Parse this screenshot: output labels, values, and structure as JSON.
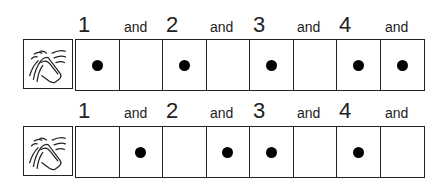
{
  "rows": [
    {
      "labels": [
        "1",
        "and",
        "2",
        "and",
        "3",
        "and",
        "4",
        "and"
      ],
      "icon": "clapping-hands-icon",
      "beats": [
        true,
        false,
        true,
        false,
        true,
        false,
        true,
        true
      ]
    },
    {
      "labels": [
        "1",
        "and",
        "2",
        "and",
        "3",
        "and",
        "4",
        "and"
      ],
      "icon": "clapping-hands-icon",
      "beats": [
        false,
        true,
        false,
        true,
        true,
        false,
        true,
        false
      ]
    }
  ]
}
